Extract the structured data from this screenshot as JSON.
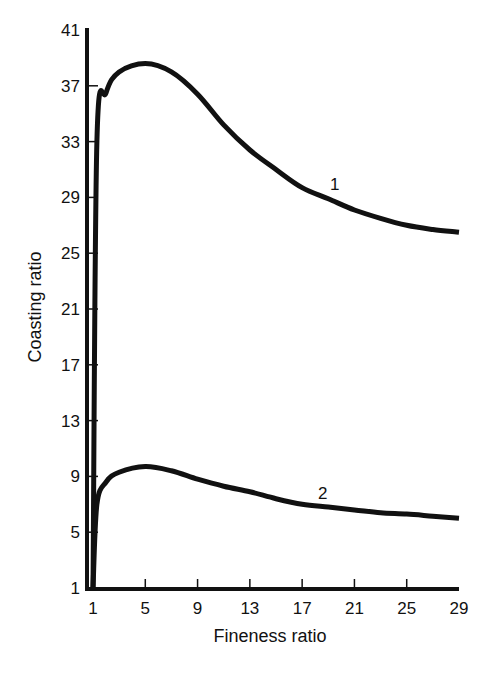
{
  "chart_data": {
    "type": "line",
    "title": "",
    "xlabel": "Fineness ratio",
    "ylabel": "Coasting ratio",
    "xlim": [
      1,
      29
    ],
    "ylim": [
      1,
      41
    ],
    "grid": false,
    "legend": "inline curve labels",
    "x_ticks": [
      1,
      5,
      9,
      13,
      17,
      21,
      25,
      29
    ],
    "y_ticks": [
      1,
      5,
      9,
      13,
      17,
      21,
      25,
      29,
      33,
      37,
      41
    ],
    "series": [
      {
        "name": "1",
        "x": [
          1,
          1.3,
          2,
          3,
          5,
          7,
          9,
          11,
          13,
          15,
          17,
          19,
          21,
          23,
          25,
          27,
          29
        ],
        "values": [
          1,
          33,
          36.5,
          38.0,
          38.6,
          38.0,
          36.4,
          34.2,
          32.4,
          31.0,
          29.7,
          28.9,
          28.1,
          27.5,
          27.0,
          26.7,
          26.5
        ]
      },
      {
        "name": "2",
        "x": [
          1,
          1.3,
          2,
          3,
          5,
          7,
          9,
          11,
          13,
          15,
          17,
          19,
          21,
          23,
          25,
          27,
          29
        ],
        "values": [
          1,
          7.0,
          8.6,
          9.3,
          9.7,
          9.4,
          8.8,
          8.3,
          7.9,
          7.4,
          7.0,
          6.8,
          6.6,
          6.4,
          6.3,
          6.15,
          6.0
        ]
      }
    ],
    "annotations": [
      {
        "text": "1",
        "x": 19.3,
        "y": 29.7
      },
      {
        "text": "2",
        "x": 18.5,
        "y": 7.5
      }
    ]
  },
  "labels": {
    "xlabel": "Fineness ratio",
    "ylabel": "Coasting ratio",
    "curve1": "1",
    "curve2": "2"
  }
}
